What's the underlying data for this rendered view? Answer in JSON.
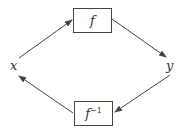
{
  "diagram": {
    "nodes": {
      "x": {
        "label": "x"
      },
      "y": {
        "label": "y"
      },
      "f": {
        "label": "f"
      },
      "f_inverse": {
        "base": "f",
        "exponent": "−1"
      }
    },
    "edges": [
      {
        "from": "x",
        "to": "f"
      },
      {
        "from": "f",
        "to": "y"
      },
      {
        "from": "y",
        "to": "f_inverse"
      },
      {
        "from": "f_inverse",
        "to": "x"
      }
    ],
    "colors": {
      "stroke": "#444444",
      "text": "#333333"
    }
  }
}
